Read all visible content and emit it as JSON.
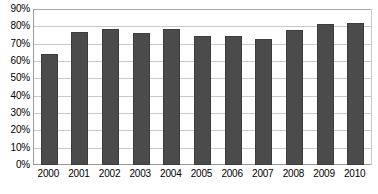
{
  "chart_data": {
    "type": "bar",
    "title": "",
    "subtitle": "",
    "xlabel": "",
    "ylabel": "",
    "categories": [
      "2000",
      "2001",
      "2002",
      "2003",
      "2004",
      "2005",
      "2006",
      "2007",
      "2008",
      "2009",
      "2010"
    ],
    "values": [
      64,
      77,
      78.5,
      76,
      78.5,
      74.5,
      74.5,
      72.5,
      78,
      81.5,
      82
    ],
    "series": [
      {
        "name": "",
        "values": [
          64,
          77,
          78.5,
          76,
          78.5,
          74.5,
          74.5,
          72.5,
          78,
          81.5,
          82
        ]
      }
    ],
    "ylim": [
      0,
      90
    ],
    "ytick_values": [
      0,
      10,
      20,
      30,
      40,
      50,
      60,
      70,
      80,
      90
    ],
    "ytick_labels": [
      "0%",
      "10%",
      "20%",
      "30%",
      "40%",
      "50%",
      "60%",
      "70%",
      "80%",
      "90%"
    ],
    "value_format": "percent",
    "grid": true,
    "grid_axis": "y",
    "legend": false,
    "legend_position": "none",
    "annotations": [],
    "colors": {
      "bar_fill": "#4b4b4b",
      "bar_border": "#3c3c3c",
      "gridline": "#c9c9c9",
      "axis_line": "#9a9a9a",
      "plot_background": "#ffffff",
      "text": "#000000"
    }
  }
}
